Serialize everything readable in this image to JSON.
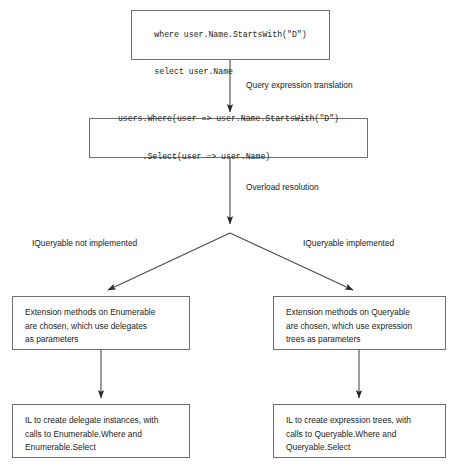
{
  "diagram": {
    "colors": {
      "background": "#ffffff",
      "box_border": "#6e6e6e",
      "text": "#1c1c1c",
      "arrow": "#2b2b2b"
    },
    "nodes": {
      "query_expression": {
        "lines": [
          "from user in users",
          "where user.Name.StartsWith(\"D\")",
          "select user.Name"
        ]
      },
      "method_calls": {
        "lines": [
          "users.Where(user => user.Name.StartsWith(\"D\")",
          "     .Select(user => user.Name)"
        ]
      },
      "enumerable_methods": {
        "lines": [
          "Extension methods on Enumerable",
          "are chosen, which use delegates",
          "as parameters"
        ]
      },
      "queryable_methods": {
        "lines": [
          "Extension methods on Queryable",
          "are chosen, which use expression",
          "trees as parameters"
        ]
      },
      "il_delegates": {
        "lines": [
          "IL to create delegate instances, with",
          "calls to Enumerable.Where and",
          "Enumerable.Select"
        ]
      },
      "il_expression_trees": {
        "lines": [
          "IL to create expression trees, with",
          "calls to Queryable.Where and",
          "Queryable.Select"
        ]
      }
    },
    "edge_labels": {
      "translation": "Query expression translation",
      "overload": "Overload resolution",
      "iqueryable_not_implemented": "IQueryable not implemented",
      "iqueryable_implemented": "IQueryable implemented"
    }
  }
}
